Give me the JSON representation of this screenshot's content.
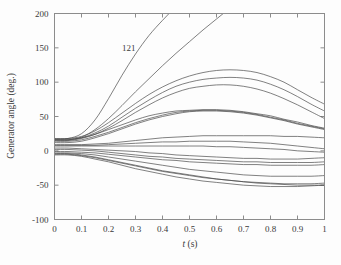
{
  "chart_data": {
    "type": "line",
    "title": "",
    "xlabel": "t (s)",
    "ylabel": "Generator angle (deg.)",
    "xlim": [
      0,
      1
    ],
    "ylim": [
      -100,
      200
    ],
    "xticks": [
      0,
      0.1,
      0.2,
      0.3,
      0.4,
      0.5,
      0.6,
      0.7,
      0.8,
      0.9,
      1
    ],
    "xticklabels": [
      "0",
      "0.1",
      "0.2",
      "0.3",
      "0.4",
      "0.5",
      "0.6",
      "0.7",
      "0.8",
      "0.9",
      "1"
    ],
    "yticks": [
      -100,
      -50,
      0,
      50,
      100,
      150,
      200
    ],
    "yticklabels": [
      "-100",
      "-50",
      "0",
      "50",
      "100",
      "150",
      "200"
    ],
    "grid": false,
    "legend": null,
    "line_color": "#4a4a4a",
    "axis_color": "#8c8c8c",
    "background": "#fdfdfd",
    "annotations": [
      {
        "text": "121",
        "x": 0.275,
        "y": 146
      }
    ],
    "x": [
      0,
      0.05,
      0.1,
      0.15,
      0.2,
      0.25,
      0.3,
      0.35,
      0.4,
      0.45,
      0.5,
      0.55,
      0.6,
      0.65,
      0.7,
      0.75,
      0.8,
      0.85,
      0.9,
      0.95,
      1
    ],
    "series": [
      {
        "name": "gen-121-unstable",
        "values": [
          17,
          18,
          25,
          45,
          76,
          110,
          141,
          168,
          190,
          210,
          228,
          244,
          259,
          273,
          286,
          298,
          310,
          321,
          332,
          342,
          352
        ]
      },
      {
        "name": "gen-unstable-2",
        "values": [
          16,
          16,
          20,
          31,
          47,
          66,
          86,
          105,
          124,
          142,
          159,
          176,
          192,
          208,
          224,
          239,
          254,
          269,
          284,
          298,
          312
        ]
      },
      {
        "name": "gen-peak-118",
        "values": [
          18,
          18,
          21,
          29,
          41,
          55,
          69,
          82,
          93,
          102,
          109,
          114,
          117,
          118,
          117,
          114,
          108,
          100,
          89,
          78,
          68
        ]
      },
      {
        "name": "gen-peak-107",
        "values": [
          16,
          16,
          19,
          26,
          36,
          49,
          62,
          74,
          85,
          94,
          100,
          104,
          106,
          107,
          106,
          103,
          97,
          89,
          79,
          68,
          58
        ]
      },
      {
        "name": "gen-peak-96",
        "values": [
          15,
          15,
          18,
          24,
          33,
          44,
          56,
          67,
          77,
          85,
          91,
          94,
          96,
          96,
          94,
          90,
          84,
          76,
          67,
          57,
          47
        ]
      },
      {
        "name": "gen-peak-60a",
        "values": [
          17,
          17,
          19,
          24,
          31,
          38,
          45,
          51,
          55,
          58,
          59,
          60,
          60,
          59,
          57,
          54,
          51,
          46,
          42,
          37,
          33
        ]
      },
      {
        "name": "gen-peak-60b",
        "values": [
          14,
          14,
          16,
          21,
          27,
          34,
          41,
          47,
          52,
          56,
          58,
          59,
          59,
          58,
          56,
          53,
          49,
          45,
          40,
          36,
          32
        ]
      },
      {
        "name": "gen-peak-58",
        "values": [
          12,
          12,
          14,
          19,
          25,
          32,
          39,
          45,
          50,
          54,
          57,
          58,
          58,
          57,
          55,
          52,
          48,
          44,
          39,
          35,
          31
        ]
      },
      {
        "name": "gen-peak-22",
        "values": [
          9,
          9,
          9,
          10,
          11,
          13,
          15,
          17,
          19,
          20,
          21,
          22,
          22,
          22,
          22,
          22,
          22,
          21,
          21,
          20,
          19
        ]
      },
      {
        "name": "gen-peak-14",
        "values": [
          8,
          8,
          8,
          8,
          9,
          10,
          11,
          12,
          13,
          13,
          14,
          14,
          14,
          14,
          13,
          12,
          11,
          9,
          7,
          5,
          3
        ]
      },
      {
        "name": "gen-flat-small",
        "values": [
          7,
          7,
          7,
          7,
          7,
          7,
          7,
          7,
          7,
          7,
          7,
          7,
          6,
          6,
          5,
          4,
          3,
          2,
          0,
          -1,
          -2
        ]
      },
      {
        "name": "gen-dip-neg12",
        "values": [
          4,
          4,
          3,
          2,
          1,
          0,
          -1,
          -3,
          -4,
          -6,
          -7,
          -8,
          -9,
          -10,
          -11,
          -11,
          -12,
          -12,
          -12,
          -11,
          -10
        ]
      },
      {
        "name": "gen-dip-neg17",
        "values": [
          2,
          2,
          1,
          0,
          -2,
          -4,
          -6,
          -8,
          -9,
          -11,
          -12,
          -13,
          -14,
          -15,
          -16,
          -16,
          -17,
          -17,
          -17,
          -17,
          -16
        ]
      },
      {
        "name": "gen-dip-neg20",
        "values": [
          -1,
          -1,
          -2,
          -3,
          -5,
          -7,
          -9,
          -11,
          -13,
          -14,
          -16,
          -17,
          -18,
          -19,
          -20,
          -20,
          -21,
          -21,
          -21,
          -21,
          -20
        ]
      },
      {
        "name": "gen-dip-neg36",
        "values": [
          -3,
          -3,
          -4,
          -6,
          -9,
          -12,
          -15,
          -18,
          -21,
          -24,
          -27,
          -29,
          -31,
          -33,
          -35,
          -36,
          -37,
          -37,
          -37,
          -37,
          -36
        ]
      },
      {
        "name": "gen-dip-neg48",
        "values": [
          -5,
          -5,
          -7,
          -10,
          -14,
          -18,
          -22,
          -26,
          -30,
          -33,
          -36,
          -39,
          -41,
          -43,
          -45,
          -46,
          -47,
          -48,
          -48,
          -48,
          -47
        ]
      },
      {
        "name": "gen-dip-neg52",
        "values": [
          -6,
          -6,
          -8,
          -12,
          -16,
          -21,
          -26,
          -30,
          -34,
          -38,
          -41,
          -44,
          -46,
          -48,
          -50,
          -51,
          -52,
          -52,
          -52,
          -51,
          -50
        ]
      },
      {
        "name": "gen-dip-neg50",
        "values": [
          -4,
          -4,
          -6,
          -9,
          -13,
          -17,
          -21,
          -25,
          -29,
          -32,
          -35,
          -38,
          -41,
          -43,
          -45,
          -47,
          -48,
          -49,
          -50,
          -50,
          -50
        ]
      }
    ]
  }
}
